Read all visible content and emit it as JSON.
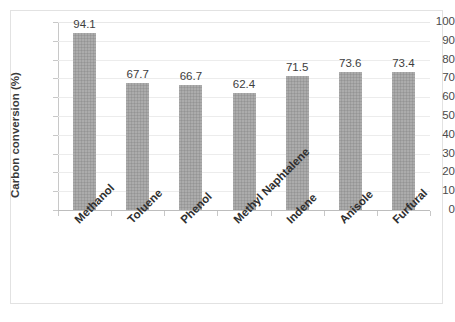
{
  "chart_data": {
    "type": "bar",
    "title": "",
    "xlabel": "",
    "ylabel": "Carbon conversion (%)",
    "ylim": [
      0,
      100
    ],
    "ytick_step": 10,
    "yticks": [
      100,
      90,
      80,
      70,
      60,
      50,
      40,
      30,
      20,
      10,
      0
    ],
    "grid": true,
    "grid_axis": "y",
    "legend": false,
    "legend_position": "none",
    "bar_color": "#9e9e9e",
    "data_labels": true,
    "categories": [
      "Methanol",
      "Toluene",
      "Phenol",
      "Methyl Naphtalene",
      "Indene",
      "Anisole",
      "Furfural"
    ],
    "values": [
      94.1,
      67.7,
      66.7,
      62.4,
      71.5,
      73.6,
      73.4
    ],
    "value_labels": [
      "94.1",
      "67.7",
      "66.7",
      "62.4",
      "71.5",
      "73.6",
      "73.4"
    ]
  }
}
